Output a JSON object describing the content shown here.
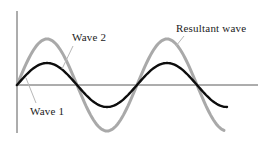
{
  "diagram": {
    "background": "#ffffff",
    "axes": {
      "color": "#5a5a5a",
      "stroke_width": 1,
      "origin_x": 17,
      "baseline_y": 85,
      "y_axis_top": 11,
      "y_axis_bottom": 133,
      "x_axis_right": 258
    },
    "waves": [
      {
        "key": "resultant",
        "name": "Resultant wave",
        "color": "#a9a9a9",
        "stroke_width": 3,
        "amplitude": 46,
        "period": 120,
        "phase_deg": 0,
        "start_x": 17,
        "end_x": 225
      },
      {
        "key": "component",
        "name": "Wave 1 and Wave 2 (identical, in phase, superimposed)",
        "color": "#0d0d0d",
        "stroke_width": 2.4,
        "amplitude": 22,
        "period": 120,
        "phase_deg": 0,
        "start_x": 17,
        "end_x": 228
      }
    ],
    "leaders": {
      "color": "#b7b7b7",
      "stroke_width": 1,
      "lines": [
        {
          "key": "wave1",
          "x1": 26,
          "y1": 78,
          "x2": 36,
          "y2": 103
        },
        {
          "key": "wave2",
          "x1": 73,
          "y1": 46,
          "x2": 62,
          "y2": 69
        },
        {
          "key": "resultant",
          "x1": 184,
          "y1": 36,
          "x2": 176,
          "y2": 46
        }
      ]
    }
  },
  "labels": {
    "wave1": {
      "text": "Wave 1",
      "x": 30,
      "y": 105
    },
    "wave2": {
      "text": "Wave 2",
      "x": 72,
      "y": 31
    },
    "resultant": {
      "text": "Resultant wave",
      "x": 176,
      "y": 22
    }
  }
}
